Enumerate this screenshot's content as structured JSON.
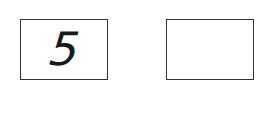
{
  "boxes": [
    {
      "value": "5"
    },
    {
      "value": ""
    }
  ],
  "colors": {
    "border": "#333333",
    "text": "#1a1a1a",
    "background": "#ffffff"
  }
}
